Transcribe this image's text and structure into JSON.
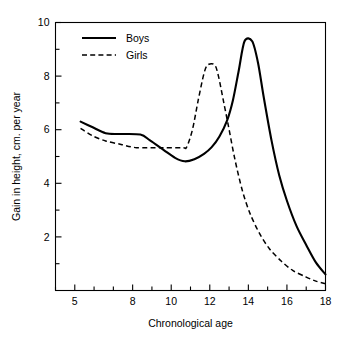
{
  "chart_data": {
    "type": "line",
    "title": "",
    "xlabel": "Chronological age",
    "ylabel": "Gain in height, cm. per year",
    "xlim": [
      4,
      18
    ],
    "ylim": [
      0,
      10
    ],
    "grid": false,
    "legend_position": "top-left",
    "x_ticks_major": [
      5,
      8,
      10,
      12,
      14,
      16,
      18
    ],
    "x_tick_labels": [
      "5",
      "8",
      "10",
      "12",
      "14",
      "16",
      "18"
    ],
    "x_ticks_minor": [
      4,
      6,
      7,
      9,
      11,
      13,
      15,
      17
    ],
    "y_ticks_major": [
      2,
      4,
      6,
      8,
      10
    ],
    "y_tick_labels": [
      "2",
      "4",
      "6",
      "8",
      "10"
    ],
    "y_ticks_minor": [
      0,
      1,
      3,
      5,
      7,
      9
    ],
    "series": [
      {
        "name": "Boys",
        "style": "solid",
        "color": "#000000",
        "points": [
          [
            5.3,
            6.3
          ],
          [
            5.9,
            6.1
          ],
          [
            6.6,
            5.87
          ],
          [
            7.3,
            5.84
          ],
          [
            8.4,
            5.82
          ],
          [
            8.9,
            5.6
          ],
          [
            9.6,
            5.25
          ],
          [
            10.2,
            4.95
          ],
          [
            10.7,
            4.82
          ],
          [
            11.2,
            4.9
          ],
          [
            11.7,
            5.1
          ],
          [
            12.1,
            5.35
          ],
          [
            12.5,
            5.75
          ],
          [
            12.9,
            6.35
          ],
          [
            13.2,
            7.1
          ],
          [
            13.5,
            8.2
          ],
          [
            13.8,
            9.3
          ],
          [
            14.2,
            9.3
          ],
          [
            14.5,
            8.5
          ],
          [
            14.8,
            7.2
          ],
          [
            15.2,
            5.6
          ],
          [
            15.6,
            4.3
          ],
          [
            16.0,
            3.35
          ],
          [
            16.5,
            2.4
          ],
          [
            17.0,
            1.7
          ],
          [
            17.5,
            1.05
          ],
          [
            18.0,
            0.6
          ]
        ]
      },
      {
        "name": "Girls",
        "style": "dashed",
        "color": "#000000",
        "points": [
          [
            5.3,
            6.05
          ],
          [
            5.9,
            5.78
          ],
          [
            6.6,
            5.58
          ],
          [
            7.4,
            5.45
          ],
          [
            8.2,
            5.33
          ],
          [
            9.5,
            5.33
          ],
          [
            10.6,
            5.33
          ],
          [
            10.8,
            5.35
          ],
          [
            11.1,
            6.0
          ],
          [
            11.4,
            7.1
          ],
          [
            11.7,
            8.1
          ],
          [
            11.9,
            8.42
          ],
          [
            12.25,
            8.42
          ],
          [
            12.45,
            8.0
          ],
          [
            12.7,
            7.1
          ],
          [
            12.95,
            6.2
          ],
          [
            13.3,
            4.9
          ],
          [
            13.7,
            3.7
          ],
          [
            14.1,
            2.85
          ],
          [
            14.6,
            2.1
          ],
          [
            15.1,
            1.55
          ],
          [
            15.7,
            1.1
          ],
          [
            16.3,
            0.75
          ],
          [
            17.0,
            0.5
          ],
          [
            17.5,
            0.35
          ],
          [
            18.0,
            0.25
          ]
        ]
      }
    ],
    "legend_entries": [
      {
        "label": "Boys",
        "style": "solid"
      },
      {
        "label": "Girls",
        "style": "dashed"
      }
    ]
  }
}
